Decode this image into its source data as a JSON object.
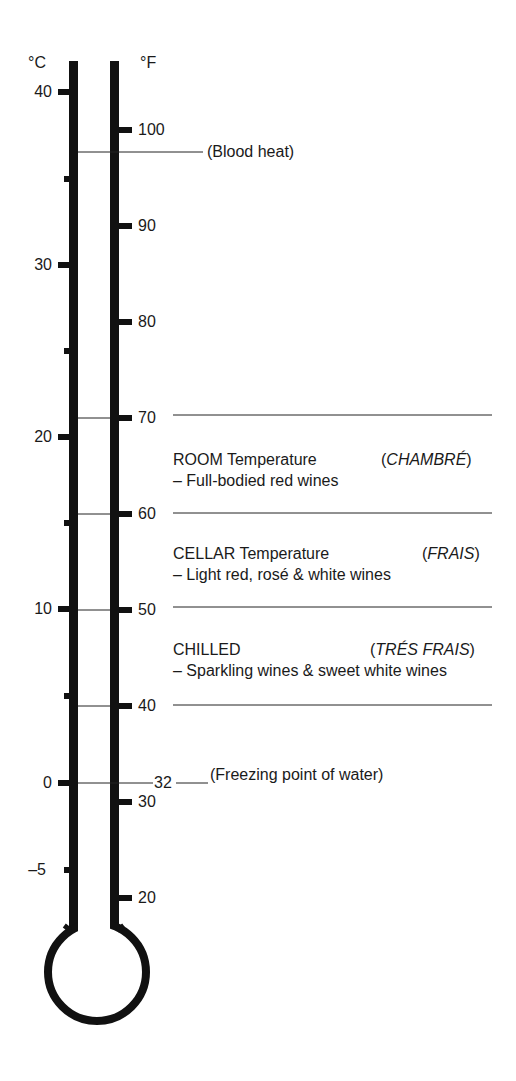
{
  "units": {
    "celsius": "°C",
    "fahrenheit": "°F"
  },
  "celsius_labels": [
    {
      "text": "40",
      "y": 92
    },
    {
      "text": "30",
      "y": 265
    },
    {
      "text": "20",
      "y": 437
    },
    {
      "text": "10",
      "y": 609
    },
    {
      "text": "0",
      "y": 783
    },
    {
      "text": "–5",
      "y": 870
    }
  ],
  "fahrenheit_labels": [
    {
      "text": "100",
      "y": 130
    },
    {
      "text": "90",
      "y": 226
    },
    {
      "text": "80",
      "y": 322
    },
    {
      "text": "70",
      "y": 418
    },
    {
      "text": "60",
      "y": 514
    },
    {
      "text": "50",
      "y": 610
    },
    {
      "text": "40",
      "y": 706
    },
    {
      "text": "30",
      "y": 802
    },
    {
      "text": "20",
      "y": 898
    }
  ],
  "annotations": {
    "blood_heat": "(Blood heat)",
    "freezing_value": "32",
    "freezing": "(Freezing point of water)"
  },
  "zones": [
    {
      "title": "ROOM Temperature",
      "french": "CHAMBRÉ",
      "desc": "– Full-bodied red wines"
    },
    {
      "title": "CELLAR Temperature",
      "french": "FRAIS",
      "desc": "– Light red, rosé & white wines"
    },
    {
      "title": "CHILLED",
      "french": "TRÉS FRAIS",
      "desc": "– Sparkling wines & sweet white wines"
    }
  ],
  "colors": {
    "ink": "#111111",
    "background": "#ffffff"
  }
}
